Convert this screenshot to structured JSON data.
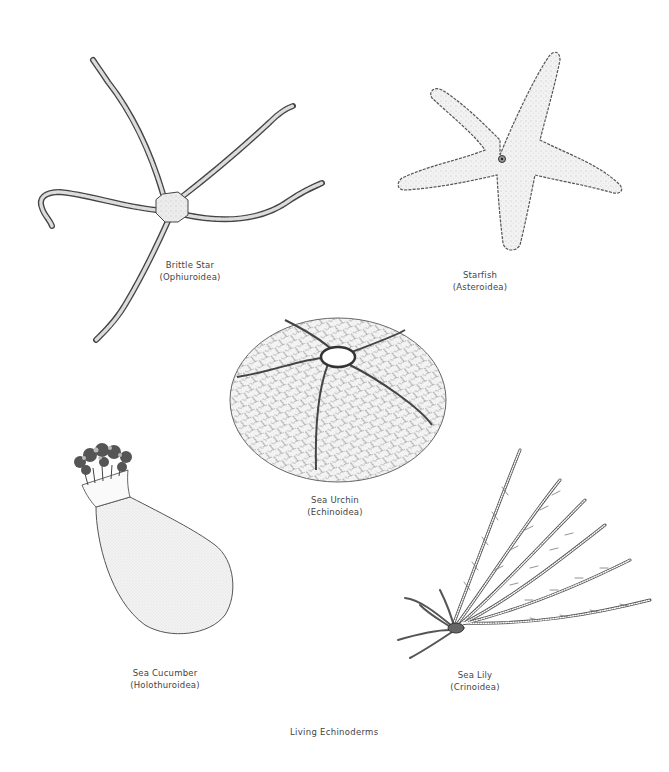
{
  "figure": {
    "title": "Living Echinoderms",
    "specimens": [
      {
        "id": "brittle-star",
        "common_name": "Brittle Star",
        "class_name": "(Ophiuroidea)"
      },
      {
        "id": "starfish",
        "common_name": "Starfish",
        "class_name": "(Asteroidea)"
      },
      {
        "id": "sea-urchin",
        "common_name": "Sea Urchin",
        "class_name": "(Echinoidea)"
      },
      {
        "id": "sea-cucumber",
        "common_name": "Sea Cucumber",
        "class_name": "(Holothuroidea)"
      },
      {
        "id": "sea-lily",
        "common_name": "Sea Lily",
        "class_name": "(Crinoidea)"
      }
    ]
  },
  "colors": {
    "background": "#ffffff",
    "ink": "#3a3a3a",
    "stipple": "#8a8a8a"
  }
}
